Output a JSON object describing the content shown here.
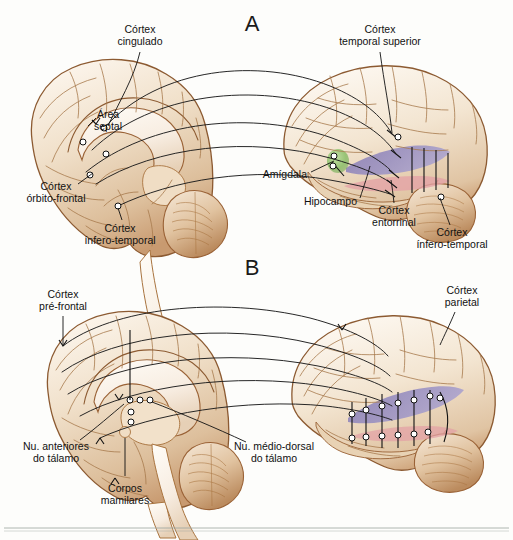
{
  "figure": {
    "panels": [
      {
        "id": "A",
        "letter": "A"
      },
      {
        "id": "B",
        "letter": "B"
      }
    ]
  },
  "colors": {
    "brain_fill": "#f2e6d6",
    "brain_mid": "#e3cdb2",
    "brain_shadow": "#c79a6b",
    "brain_outline": "#8c5a31",
    "white_matter": "#fbf5ec",
    "hippocampus_purple": "#8a7fb8",
    "amygdala_green": "#8cbf6a",
    "entorhinal_pink": "#e3a2a6",
    "line_black": "#1b1b1b",
    "label_text": "#111111",
    "background": "#fdfdfb",
    "rule": "#9aa3a0"
  },
  "panel_a": {
    "letter": "A",
    "left_brain_view": "medial-sagittal",
    "right_brain_view": "lateral",
    "labels": [
      {
        "id": "cortex-cingulado",
        "line1": "Córtex",
        "line2": "cingulado",
        "anchor": "middle",
        "x": 140,
        "y": 33,
        "lead": "M140,52 L108,128"
      },
      {
        "id": "area-septal",
        "line1": "Área",
        "line2": "septal",
        "anchor": "middle",
        "x": 108,
        "y": 118,
        "lead": ""
      },
      {
        "id": "cortex-orbito-frontal",
        "line1": "Córtex",
        "line2": "órbito-frontal",
        "anchor": "middle",
        "x": 56,
        "y": 190,
        "lead": "M78,184 L92,172"
      },
      {
        "id": "cortex-infero-temporal-l",
        "line1": "Córtex",
        "line2": "ínfero-temporal",
        "anchor": "middle",
        "x": 120,
        "y": 228,
        "lead": "M120,221 L118,206"
      },
      {
        "id": "cortex-temporal-superior",
        "line1": "Córtex",
        "line2": "temporal superior",
        "anchor": "middle",
        "x": 380,
        "y": 33,
        "lead": "M380,52 L390,135"
      },
      {
        "id": "amigdala",
        "line1": "Amígdala",
        "line2": "",
        "anchor": "end",
        "x": 307,
        "y": 175,
        "lead": "M311,172 L336,160"
      },
      {
        "id": "hipocampo",
        "line1": "Hipocampo",
        "line2": "",
        "anchor": "end",
        "x": 357,
        "y": 203,
        "lead": "M360,199 L369,166"
      },
      {
        "id": "cortex-entorrinal",
        "line1": "Córtex",
        "line2": "entorrinal",
        "anchor": "middle",
        "x": 394,
        "y": 211,
        "lead": "M394,204 L392,182"
      },
      {
        "id": "cortex-infero-temporal-r",
        "line1": "Córtex",
        "line2": "ínfero-temporal",
        "anchor": "middle",
        "x": 450,
        "y": 233,
        "lead": "M450,226 L441,197"
      }
    ],
    "structures": [
      {
        "id": "hippocampus",
        "label": "Hipocampo",
        "color": "#8a7fb8"
      },
      {
        "id": "amygdala",
        "label": "Amígdala",
        "color": "#8cbf6a"
      },
      {
        "id": "entorhinal",
        "label": "Córtex entorrinal",
        "color": "#e3a2a6"
      }
    ],
    "projection_count": 5
  },
  "panel_b": {
    "letter": "B",
    "left_brain_view": "medial-sagittal",
    "right_brain_view": "lateral",
    "labels": [
      {
        "id": "cortex-pre-frontal",
        "line1": "Córtex",
        "line2": "pré-frontal",
        "anchor": "middle",
        "x": 63,
        "y": 298,
        "lead": "M63,317 L63,346"
      },
      {
        "id": "cortex-parietal",
        "line1": "Córtex",
        "line2": "parietal",
        "anchor": "middle",
        "x": 460,
        "y": 294,
        "lead": "M455,312 L440,344"
      },
      {
        "id": "nu-anteriores-talamo",
        "line1": "Nu. anteriores",
        "line2": "do tálamo",
        "anchor": "middle",
        "x": 56,
        "y": 447,
        "lead": "M80,440 L122,400"
      },
      {
        "id": "nu-medio-dorsal-talamo",
        "line1": "Nu. médio-dorsal",
        "line2": "do tálamo",
        "anchor": "middle",
        "x": 272,
        "y": 447,
        "lead": "M244,443 L150,400"
      },
      {
        "id": "corpos-mamilares",
        "line1": "Corpos",
        "line2": "mamilares",
        "anchor": "middle",
        "x": 125,
        "y": 489,
        "lead": "M125,476 L125,432"
      }
    ],
    "structures": [
      {
        "id": "parietal-band",
        "label": "Córtex parietal",
        "color": "#8a7fb8"
      },
      {
        "id": "temporal-band",
        "label": "Banda temporal",
        "color": "#e3a2a6"
      }
    ],
    "projection_count": 5
  }
}
